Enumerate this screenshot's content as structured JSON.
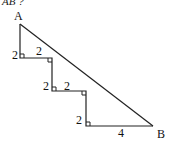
{
  "header": {
    "partial_text": "AB ?"
  },
  "diagram": {
    "vertex_a": "A",
    "vertex_b": "B",
    "segments": [
      {
        "id": "v1",
        "label": "2"
      },
      {
        "id": "h1",
        "label": "2"
      },
      {
        "id": "v2",
        "label": "2"
      },
      {
        "id": "h2",
        "label": "2"
      },
      {
        "id": "v3",
        "label": "2"
      },
      {
        "id": "h3",
        "label": "4"
      }
    ],
    "line_color": "#222222"
  }
}
